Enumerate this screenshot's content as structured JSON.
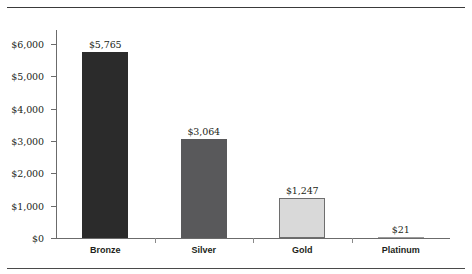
{
  "chart_data": {
    "type": "bar",
    "title": "",
    "subtitle": "",
    "xlabel": "",
    "ylabel": "",
    "categories": [
      "Bronze",
      "Silver",
      "Gold",
      "Platinum"
    ],
    "values": [
      5765,
      3064,
      1247,
      21
    ],
    "value_labels": [
      "$5,765",
      "$3,064",
      "$1,247",
      "$21"
    ],
    "ylim": [
      0,
      6000
    ],
    "ytick_values": [
      0,
      1000,
      2000,
      3000,
      4000,
      5000,
      6000
    ],
    "ytick_labels": [
      "$0",
      "$1,000",
      "$2,000",
      "$3,000",
      "$4,000",
      "$5,000",
      "$6,000"
    ],
    "grid": false,
    "legend": null,
    "series": [
      {
        "name": "Amount",
        "values": [
          5765,
          3064,
          1247,
          21
        ]
      }
    ],
    "bar_colors": [
      "#2b2b2b",
      "#59595b",
      "#d9d9d9",
      "#9a9a9a"
    ],
    "bar_border_colors": [
      "#2b2b2b",
      "#59595b",
      "#6e6e6e",
      "#6e6e6e"
    ],
    "axis_color": "#6b6b6b",
    "text_color": "#231f20",
    "rule_color": "#3a3a3a",
    "background": "#ffffff"
  },
  "rules": {
    "top": "",
    "bottom": ""
  }
}
